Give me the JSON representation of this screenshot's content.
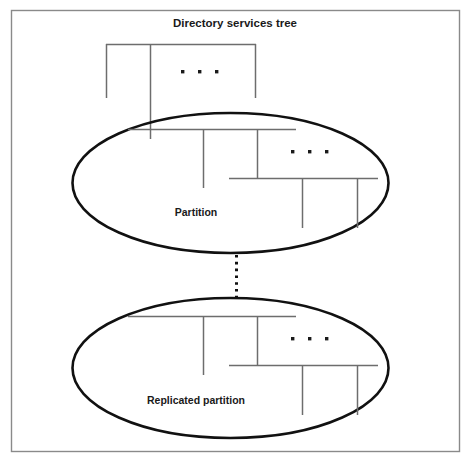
{
  "figure": {
    "title": "Directory services tree",
    "regions": [
      {
        "id": "partition",
        "label": "Partition"
      },
      {
        "id": "replicated-partition",
        "label": "Replicated partition"
      }
    ],
    "ellipsis_label": "...",
    "colors": {
      "frame_border": "#8a8a8a",
      "ellipse_stroke": "#111111",
      "tree_line": "#6d6d6d",
      "text": "#1a1a1a",
      "background": "#ffffff"
    }
  },
  "diagram_data": {
    "type": "diagram",
    "description": "Directory services tree split into a partition and its replicated copy",
    "nodes": [
      {
        "id": "root-tree",
        "label": "Directory services tree",
        "kind": "title"
      },
      {
        "id": "partition",
        "label": "Partition",
        "kind": "ellipse-region"
      },
      {
        "id": "replicated-partition",
        "label": "Replicated partition",
        "kind": "ellipse-region"
      }
    ],
    "edges": [
      {
        "from": "partition",
        "to": "replicated-partition",
        "style": "dotted",
        "label": ""
      }
    ],
    "ellipsis_markers": 3
  }
}
